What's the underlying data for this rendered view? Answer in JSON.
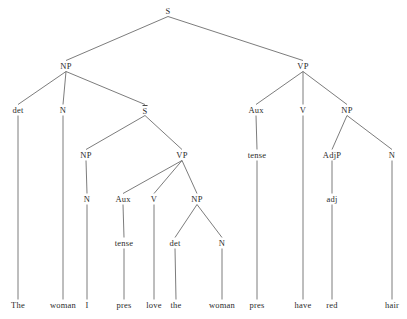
{
  "diagram": {
    "type": "syntax-tree",
    "sentence": "The woman I pres love pres have red hair",
    "line_color": "#5a5a5a",
    "text_color": "#2b2b2b",
    "background": "#ffffff",
    "nodes": [
      {
        "id": "s-root",
        "label": "S",
        "x": 168,
        "y": 11,
        "kind": "nonterminal",
        "overline": false
      },
      {
        "id": "np-subj",
        "label": "NP",
        "x": 66,
        "y": 66,
        "kind": "nonterminal",
        "overline": false
      },
      {
        "id": "vp-main",
        "label": "VP",
        "x": 303,
        "y": 66,
        "kind": "nonterminal",
        "overline": false
      },
      {
        "id": "det-1",
        "label": "det",
        "x": 18,
        "y": 110,
        "kind": "nonterminal",
        "overline": false
      },
      {
        "id": "n-1",
        "label": "N",
        "x": 63,
        "y": 110,
        "kind": "nonterminal",
        "overline": false
      },
      {
        "id": "sbar",
        "label": "S",
        "x": 145,
        "y": 110,
        "kind": "nonterminal",
        "overline": true
      },
      {
        "id": "aux-main",
        "label": "Aux",
        "x": 256,
        "y": 110,
        "kind": "nonterminal",
        "overline": false
      },
      {
        "id": "v-main",
        "label": "V",
        "x": 303,
        "y": 110,
        "kind": "nonterminal",
        "overline": false
      },
      {
        "id": "np-obj-main",
        "label": "NP",
        "x": 347,
        "y": 110,
        "kind": "nonterminal",
        "overline": false
      },
      {
        "id": "np-embed",
        "label": "NP",
        "x": 86,
        "y": 155,
        "kind": "nonterminal",
        "overline": false
      },
      {
        "id": "vp-embed",
        "label": "VP",
        "x": 182,
        "y": 155,
        "kind": "nonterminal",
        "overline": false
      },
      {
        "id": "tense-main",
        "label": "tense",
        "x": 257,
        "y": 155,
        "kind": "nonterminal",
        "overline": false
      },
      {
        "id": "adjp",
        "label": "AdjP",
        "x": 332,
        "y": 155,
        "kind": "nonterminal",
        "overline": false
      },
      {
        "id": "n-hair",
        "label": "N",
        "x": 392,
        "y": 155,
        "kind": "nonterminal",
        "overline": false
      },
      {
        "id": "n-embed-subj",
        "label": "N",
        "x": 87,
        "y": 199,
        "kind": "nonterminal",
        "overline": false
      },
      {
        "id": "aux-embed",
        "label": "Aux",
        "x": 123,
        "y": 199,
        "kind": "nonterminal",
        "overline": false
      },
      {
        "id": "v-embed",
        "label": "V",
        "x": 154,
        "y": 199,
        "kind": "nonterminal",
        "overline": false
      },
      {
        "id": "np-obj-embed",
        "label": "NP",
        "x": 197,
        "y": 199,
        "kind": "nonterminal",
        "overline": false
      },
      {
        "id": "adj",
        "label": "adj",
        "x": 332,
        "y": 199,
        "kind": "nonterminal",
        "overline": false
      },
      {
        "id": "tense-embed",
        "label": "tense",
        "x": 124,
        "y": 243,
        "kind": "nonterminal",
        "overline": false
      },
      {
        "id": "det-2",
        "label": "det",
        "x": 175,
        "y": 243,
        "kind": "nonterminal",
        "overline": false
      },
      {
        "id": "n-2",
        "label": "N",
        "x": 222,
        "y": 243,
        "kind": "nonterminal",
        "overline": false
      },
      {
        "id": "w-the-1",
        "label": "The",
        "x": 18,
        "y": 305,
        "kind": "terminal",
        "overline": false
      },
      {
        "id": "w-woman-1",
        "label": "woman",
        "x": 63,
        "y": 305,
        "kind": "terminal",
        "overline": false
      },
      {
        "id": "w-i",
        "label": "I",
        "x": 87,
        "y": 305,
        "kind": "terminal",
        "overline": false
      },
      {
        "id": "w-pres-1",
        "label": "pres",
        "x": 124,
        "y": 305,
        "kind": "terminal",
        "overline": false
      },
      {
        "id": "w-love",
        "label": "love",
        "x": 154,
        "y": 305,
        "kind": "terminal",
        "overline": false
      },
      {
        "id": "w-the-2",
        "label": "the",
        "x": 176,
        "y": 305,
        "kind": "terminal",
        "overline": false
      },
      {
        "id": "w-woman-2",
        "label": "woman",
        "x": 222,
        "y": 305,
        "kind": "terminal",
        "overline": false
      },
      {
        "id": "w-pres-2",
        "label": "pres",
        "x": 257,
        "y": 305,
        "kind": "terminal",
        "overline": false
      },
      {
        "id": "w-have",
        "label": "have",
        "x": 303,
        "y": 305,
        "kind": "terminal",
        "overline": false
      },
      {
        "id": "w-red",
        "label": "red",
        "x": 332,
        "y": 305,
        "kind": "terminal",
        "overline": false
      },
      {
        "id": "w-hair",
        "label": "hair",
        "x": 392,
        "y": 305,
        "kind": "terminal",
        "overline": false
      }
    ],
    "edges": [
      {
        "from": "s-root",
        "to": "np-subj"
      },
      {
        "from": "s-root",
        "to": "vp-main"
      },
      {
        "from": "np-subj",
        "to": "det-1"
      },
      {
        "from": "np-subj",
        "to": "n-1"
      },
      {
        "from": "np-subj",
        "to": "sbar"
      },
      {
        "from": "vp-main",
        "to": "aux-main"
      },
      {
        "from": "vp-main",
        "to": "v-main"
      },
      {
        "from": "vp-main",
        "to": "np-obj-main"
      },
      {
        "from": "sbar",
        "to": "np-embed"
      },
      {
        "from": "sbar",
        "to": "vp-embed"
      },
      {
        "from": "aux-main",
        "to": "tense-main"
      },
      {
        "from": "np-obj-main",
        "to": "adjp"
      },
      {
        "from": "np-obj-main",
        "to": "n-hair"
      },
      {
        "from": "np-embed",
        "to": "n-embed-subj"
      },
      {
        "from": "vp-embed",
        "to": "aux-embed"
      },
      {
        "from": "vp-embed",
        "to": "v-embed"
      },
      {
        "from": "vp-embed",
        "to": "np-obj-embed"
      },
      {
        "from": "adjp",
        "to": "adj"
      },
      {
        "from": "aux-embed",
        "to": "tense-embed"
      },
      {
        "from": "np-obj-embed",
        "to": "det-2"
      },
      {
        "from": "np-obj-embed",
        "to": "n-2"
      },
      {
        "from": "det-1",
        "to": "w-the-1"
      },
      {
        "from": "n-1",
        "to": "w-woman-1"
      },
      {
        "from": "n-embed-subj",
        "to": "w-i"
      },
      {
        "from": "tense-embed",
        "to": "w-pres-1"
      },
      {
        "from": "v-embed",
        "to": "w-love"
      },
      {
        "from": "det-2",
        "to": "w-the-2"
      },
      {
        "from": "n-2",
        "to": "w-woman-2"
      },
      {
        "from": "tense-main",
        "to": "w-pres-2"
      },
      {
        "from": "v-main",
        "to": "w-have"
      },
      {
        "from": "adj",
        "to": "w-red"
      },
      {
        "from": "n-hair",
        "to": "w-hair"
      }
    ]
  }
}
